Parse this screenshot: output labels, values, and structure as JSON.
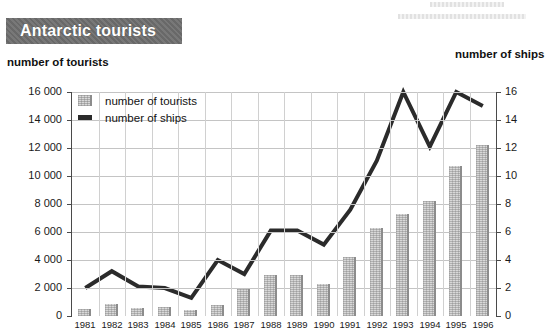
{
  "title": "Antarctic tourists",
  "axis_titles": {
    "left": "number of tourists",
    "right": "number of ships"
  },
  "legend": {
    "tourists": "number of tourists",
    "ships": "number of ships"
  },
  "artifacts": {
    "top_right_a": "",
    "top_right_b": ""
  },
  "colors": {
    "banner_bg": "#6e6e6e",
    "banner_text": "#ffffff",
    "bar_fill": "#d8d8d8",
    "bar_edge": "#8c8c8c",
    "line": "#2b2b2b",
    "grid": "#c4c4c4",
    "axis": "#4a4a4a"
  },
  "chart_data": {
    "type": "bar",
    "title": "Antarctic tourists",
    "xlabel": "",
    "ylabel": "number of tourists",
    "y2label": "number of ships",
    "grid": true,
    "legend_position": "top-left-inside",
    "ylim": [
      0,
      16000
    ],
    "y2lim": [
      0,
      16
    ],
    "yticks": [
      "0",
      "2 000",
      "4 000",
      "6 000",
      "8 000",
      "10 000",
      "12 000",
      "14 000",
      "16 000"
    ],
    "y2ticks": [
      "0",
      "2",
      "4",
      "6",
      "8",
      "10",
      "12",
      "14",
      "16"
    ],
    "categories": [
      "1981",
      "1982",
      "1983",
      "1984",
      "1985",
      "1986",
      "1987",
      "1988",
      "1989",
      "1990",
      "1991",
      "1992",
      "1993",
      "1994",
      "1995",
      "1996"
    ],
    "series": [
      {
        "name": "number of tourists",
        "type": "bar",
        "axis": "left",
        "values": [
          500,
          850,
          550,
          650,
          400,
          800,
          1900,
          2950,
          2950,
          2300,
          4250,
          6300,
          7300,
          8200,
          10700,
          12250
        ]
      },
      {
        "name": "number of ships",
        "type": "line",
        "axis": "right",
        "values": [
          2.0,
          3.2,
          2.1,
          2.0,
          1.3,
          4.0,
          3.0,
          6.1,
          6.1,
          5.1,
          7.6,
          11.1,
          16.0,
          12.1,
          16.0,
          15.0
        ]
      }
    ]
  }
}
